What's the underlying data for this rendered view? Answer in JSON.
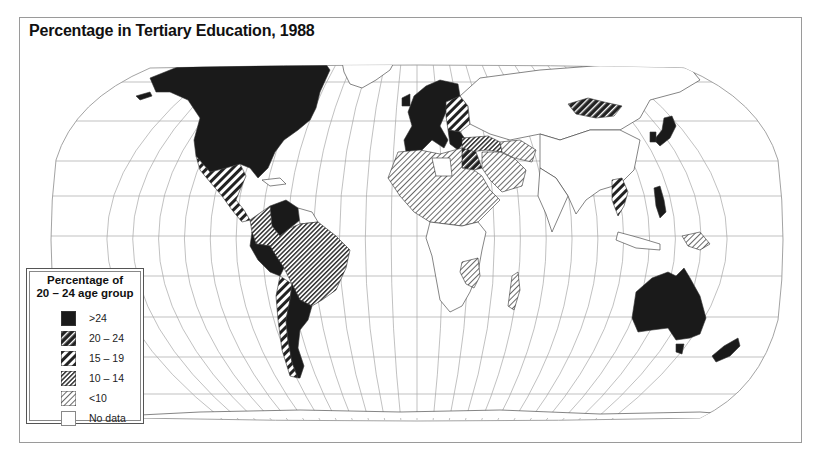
{
  "title": "Percentage in Tertiary Education, 1988",
  "legend": {
    "title_line1": "Percentage of",
    "title_line2": "20 – 24 age group",
    "items": [
      {
        "label": ">24",
        "pattern": "solid"
      },
      {
        "label": "20 – 24",
        "pattern": "dense-thick"
      },
      {
        "label": "15 – 19",
        "pattern": "thick-stripe"
      },
      {
        "label": "10 – 14",
        "pattern": "fine-dense"
      },
      {
        "label": "<10",
        "pattern": "fine-light"
      },
      {
        "label": "No data",
        "pattern": "none"
      }
    ]
  },
  "colors": {
    "ink": "#1a1a1a",
    "graticule": "#9c9c9c",
    "frame": "#9a9a9a",
    "background": "#ffffff"
  },
  "chart_data": {
    "type": "choropleth-map",
    "title": "Percentage in Tertiary Education, 1988",
    "projection": "Robinson (world)",
    "legend_title": "Percentage of 20 – 24 age group",
    "classes": [
      ">24",
      "20 – 24",
      "15 – 19",
      "10 – 14",
      "<10",
      "No data"
    ],
    "regions": [
      {
        "name": "North America (USA, Canada)",
        "class": ">24"
      },
      {
        "name": "Mexico & Central America",
        "class": "15 – 19"
      },
      {
        "name": "Venezuela",
        "class": ">24"
      },
      {
        "name": "Colombia",
        "class": "10 – 14"
      },
      {
        "name": "Peru / Ecuador",
        "class": ">24"
      },
      {
        "name": "Brazil",
        "class": "10 – 14"
      },
      {
        "name": "Chile",
        "class": "15 – 19"
      },
      {
        "name": "Argentina",
        "class": ">24"
      },
      {
        "name": "Western & Northern Europe",
        "class": ">24"
      },
      {
        "name": "Eastern Europe",
        "class": "15 – 19"
      },
      {
        "name": "Turkey / Middle East",
        "class": "10 – 14"
      },
      {
        "name": "Egypt",
        "class": "20 – 24"
      },
      {
        "name": "Saudi Arabia / Iran",
        "class": "<10"
      },
      {
        "name": "North & Central Africa",
        "class": "<10"
      },
      {
        "name": "East-central Africa",
        "class": "<10"
      },
      {
        "name": "Madagascar",
        "class": "<10"
      },
      {
        "name": "Mongolia",
        "class": "20 – 24"
      },
      {
        "name": "Japan / South Korea",
        "class": ">24"
      },
      {
        "name": "Philippines",
        "class": ">24"
      },
      {
        "name": "Thailand",
        "class": "15 – 19"
      },
      {
        "name": "Southeast Asia (other)",
        "class": "<10"
      },
      {
        "name": "Australia",
        "class": ">24"
      },
      {
        "name": "New Zealand",
        "class": ">24"
      },
      {
        "name": "USSR / China / India",
        "class": "No data"
      }
    ]
  }
}
